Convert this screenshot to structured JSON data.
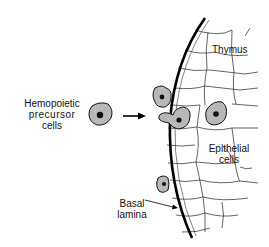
{
  "diagram": {
    "labels": {
      "hemopoietic_line1": "Hemopoietic",
      "hemopoietic_line2": "precursor",
      "hemopoietic_line3": "cells",
      "thymus": "Thymus",
      "epithelial_line1": "Epithelial",
      "epithelial_line2": "cells",
      "basal_line1": "Basal",
      "basal_line2": "lamina"
    },
    "colors": {
      "cell_fill": "#b8b8b8",
      "nucleus": "#111111",
      "line": "#111111",
      "background": "#ffffff"
    }
  }
}
